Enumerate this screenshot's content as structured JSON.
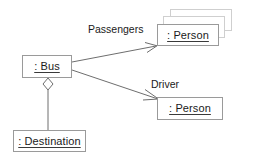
{
  "diagram": {
    "type": "uml-object-diagram",
    "background_color": "#ffffff",
    "border_color": "#9a9a9a",
    "ghost_border_color": "#cfcfcf",
    "line_color": "#6e6e6e",
    "text_color": "#1a1a1a",
    "nodes": [
      {
        "id": "bus",
        "label": ": Bus",
        "x": 22,
        "y": 55,
        "w": 50,
        "h": 23
      },
      {
        "id": "passengers",
        "label": ": Person",
        "x": 157,
        "y": 24,
        "w": 62,
        "h": 22
      },
      {
        "id": "driver",
        "label": ": Person",
        "x": 157,
        "y": 97,
        "w": 66,
        "h": 23
      },
      {
        "id": "destination",
        "label": ": Destination",
        "x": 13,
        "y": 130,
        "w": 73,
        "h": 22
      }
    ],
    "stacked_copies": [
      {
        "id": "passengers-copy-2",
        "x": 163,
        "y": 16,
        "w": 62,
        "h": 22
      },
      {
        "id": "passengers-copy-3",
        "x": 170,
        "y": 9,
        "w": 62,
        "h": 22
      }
    ],
    "edges": [
      {
        "id": "bus-passengers",
        "label": "Passengers",
        "from": "bus",
        "to": "passengers",
        "kind": "association-open-arrow",
        "label_x": 88,
        "label_y": 24
      },
      {
        "id": "bus-driver",
        "label": "Driver",
        "from": "bus",
        "to": "driver",
        "kind": "association-open-arrow",
        "label_x": 151,
        "label_y": 79
      },
      {
        "id": "bus-destination",
        "label": "",
        "from": "bus",
        "to": "destination",
        "kind": "aggregation-hollow-diamond",
        "label_x": 0,
        "label_y": 0
      }
    ]
  }
}
